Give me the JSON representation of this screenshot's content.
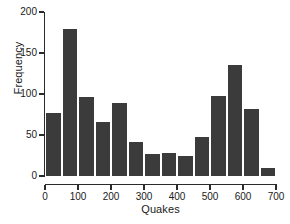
{
  "chart_data": {
    "type": "bar",
    "title": "",
    "subtitle": "",
    "xlabel": "Quakes",
    "ylabel": "Frequency",
    "xlim": [
      0,
      700
    ],
    "ylim": [
      0,
      200
    ],
    "grid": false,
    "legend": null,
    "bin_width": 50,
    "bin_edges": [
      0,
      50,
      100,
      150,
      200,
      250,
      300,
      350,
      400,
      450,
      500,
      550,
      600,
      650,
      700
    ],
    "categories": [
      "0-50",
      "50-100",
      "100-150",
      "150-200",
      "200-250",
      "250-300",
      "300-350",
      "350-400",
      "400-450",
      "450-500",
      "500-550",
      "550-600",
      "600-650",
      "650-700"
    ],
    "values": [
      77,
      179,
      96,
      66,
      89,
      41,
      27,
      28,
      25,
      47,
      97,
      135,
      82,
      10
    ],
    "xticks": [
      0,
      100,
      200,
      300,
      400,
      500,
      600,
      700
    ],
    "xtick_labels": [
      "0",
      "100",
      "200",
      "300",
      "400",
      "500",
      "600",
      "700"
    ],
    "yticks": [
      0,
      50,
      100,
      150,
      200
    ],
    "ytick_labels": [
      "0",
      "50",
      "100",
      "150",
      "200"
    ],
    "bar_color": "#3b3b3b",
    "bar_edge_color": "#ffffff",
    "axis_color": "#2b2b2b",
    "background_color": "#ffffff"
  }
}
